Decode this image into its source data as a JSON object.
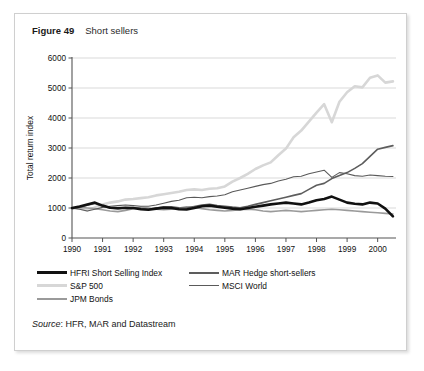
{
  "figure": {
    "number": "Figure 49",
    "title": "Short sellers",
    "source_word": "Source",
    "source_text": ": HFR, MAR and Datastream"
  },
  "colors": {
    "hfri": "#111111",
    "mar_hedge": "#5d5d5d",
    "sp500": "#d7d7d7",
    "msci_world": "#5a5a5a",
    "jpm_bonds": "#9a9a9a",
    "axis": "#555555",
    "grid": "#c8c8c8",
    "border": "#cfcfcf"
  },
  "chart_data": {
    "type": "line",
    "title": "Short sellers",
    "xlabel": "",
    "ylabel": "Total return index",
    "xlim": [
      1990,
      2000.6
    ],
    "ylim": [
      0,
      6000
    ],
    "grid": true,
    "legend_position": "below",
    "x_ticks": [
      "1990",
      "1991",
      "1992",
      "1993",
      "1994",
      "1995",
      "1996",
      "1997",
      "1998",
      "1999",
      "2000"
    ],
    "y_ticks": [
      "0",
      "1000",
      "2000",
      "3000",
      "4000",
      "5000",
      "6000"
    ],
    "x": [
      1990.0,
      1990.25,
      1990.5,
      1990.75,
      1991.0,
      1991.25,
      1991.5,
      1991.75,
      1992.0,
      1992.25,
      1992.5,
      1992.75,
      1993.0,
      1993.25,
      1993.5,
      1993.75,
      1994.0,
      1994.25,
      1994.5,
      1994.75,
      1995.0,
      1995.25,
      1995.5,
      1995.75,
      1996.0,
      1996.25,
      1996.5,
      1996.75,
      1997.0,
      1997.25,
      1997.5,
      1997.75,
      1998.0,
      1998.25,
      1998.5,
      1998.75,
      1999.0,
      1999.25,
      1999.5,
      1999.75,
      2000.0,
      2000.25,
      2000.5
    ],
    "series": [
      {
        "name": "HFRI Short Selling Index",
        "color": "#111111",
        "width": 2.6,
        "values": [
          1000,
          1050,
          1120,
          1180,
          1080,
          1010,
          990,
          1010,
          1000,
          960,
          940,
          980,
          1010,
          1000,
          960,
          950,
          1000,
          1060,
          1080,
          1040,
          1010,
          980,
          960,
          1000,
          1040,
          1080,
          1120,
          1150,
          1180,
          1150,
          1120,
          1180,
          1260,
          1300,
          1380,
          1280,
          1180,
          1140,
          1120,
          1180,
          1150,
          980,
          720
        ]
      },
      {
        "name": "MAR Hedge short-sellers",
        "color": "#5d5d5d",
        "width": 1.6,
        "values": [
          980,
          1030,
          1090,
          1150,
          1060,
          1000,
          980,
          1000,
          1010,
          980,
          960,
          1000,
          1040,
          1040,
          1010,
          1000,
          1050,
          1100,
          1120,
          1080,
          1060,
          1030,
          1010,
          1060,
          1120,
          1180,
          1240,
          1300,
          1360,
          1420,
          1480,
          1620,
          1760,
          1820,
          1980,
          2080,
          2180,
          2320,
          2480,
          2720,
          2960,
          3020,
          3080
        ]
      },
      {
        "name": "S&P 500",
        "color": "#d7d7d7",
        "width": 2.6,
        "values": [
          1000,
          980,
          920,
          1020,
          1120,
          1180,
          1220,
          1280,
          1300,
          1330,
          1360,
          1420,
          1460,
          1500,
          1540,
          1600,
          1620,
          1600,
          1640,
          1660,
          1720,
          1880,
          2000,
          2140,
          2300,
          2420,
          2520,
          2760,
          2980,
          3360,
          3580,
          3880,
          4180,
          4460,
          3860,
          4540,
          4860,
          5060,
          5020,
          5340,
          5420,
          5180,
          5220
        ]
      },
      {
        "name": "MSCI World",
        "color": "#5a5a5a",
        "width": 1.1,
        "values": [
          1000,
          960,
          900,
          960,
          1020,
          1060,
          1080,
          1100,
          1080,
          1060,
          1060,
          1100,
          1160,
          1220,
          1260,
          1340,
          1360,
          1340,
          1380,
          1400,
          1440,
          1540,
          1600,
          1660,
          1720,
          1780,
          1820,
          1900,
          1960,
          2040,
          2060,
          2140,
          2200,
          2260,
          2020,
          2180,
          2140,
          2080,
          2060,
          2100,
          2080,
          2060,
          2050
        ]
      },
      {
        "name": "JPM Bonds",
        "color": "#9a9a9a",
        "width": 1.6,
        "values": [
          1000,
          1020,
          1000,
          980,
          940,
          900,
          880,
          920,
          980,
          1020,
          1000,
          960,
          940,
          960,
          1000,
          1040,
          1020,
          980,
          940,
          920,
          900,
          920,
          940,
          960,
          940,
          900,
          880,
          900,
          920,
          900,
          880,
          900,
          920,
          940,
          960,
          940,
          920,
          900,
          880,
          860,
          840,
          820,
          800
        ]
      }
    ]
  }
}
